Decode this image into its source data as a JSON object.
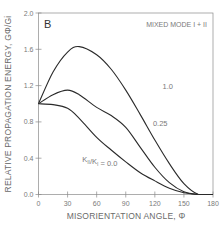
{
  "chart_data": {
    "type": "line",
    "panel_label": "B",
    "title": "",
    "annotation": "MIXED MODE I + II",
    "xlabel": "MISORIENTATION ANGLE, Φ",
    "ylabel": "RELATIVE PROPAGATION ENERGY, GΦ/Gi",
    "xlim": [
      0,
      180
    ],
    "ylim": [
      0,
      2.0
    ],
    "xticks": [
      0,
      30,
      60,
      90,
      120,
      150,
      180
    ],
    "xtick_labels": [
      "0",
      "30",
      "60",
      "90",
      "120",
      "150",
      "180"
    ],
    "yticks": [
      0.0,
      0.4,
      0.8,
      1.2,
      1.6,
      2.0
    ],
    "ytick_labels": [
      "0.0",
      "0.4",
      "0.8",
      "1.2",
      "1.6",
      "2.0"
    ],
    "grid": false,
    "legend": "inline labels",
    "series_label_prefix": "K II/K I = ",
    "x": [
      0,
      15,
      30,
      42,
      60,
      75,
      90,
      105,
      120,
      135,
      150,
      165,
      180
    ],
    "series": [
      {
        "name": "1.0",
        "label": "1.0",
        "values": [
          1.0,
          1.35,
          1.57,
          1.63,
          1.54,
          1.38,
          1.15,
          0.88,
          0.6,
          0.34,
          0.12,
          0.0,
          0.0
        ]
      },
      {
        "name": "0.25",
        "label": "0.25",
        "values": [
          1.0,
          1.1,
          1.15,
          1.1,
          0.96,
          0.87,
          0.74,
          0.52,
          0.3,
          0.13,
          0.03,
          0.0,
          0.0
        ]
      },
      {
        "name": "0.0",
        "label": "K II/K I = 0.0",
        "values": [
          1.0,
          0.99,
          0.95,
          0.84,
          0.63,
          0.49,
          0.36,
          0.24,
          0.15,
          0.07,
          0.02,
          0.0,
          0.0
        ]
      }
    ],
    "series_label_positions": [
      {
        "x": 128,
        "y": 1.16
      },
      {
        "x": 118,
        "y": 0.76
      },
      {
        "x": 45,
        "y": 0.36
      }
    ]
  }
}
